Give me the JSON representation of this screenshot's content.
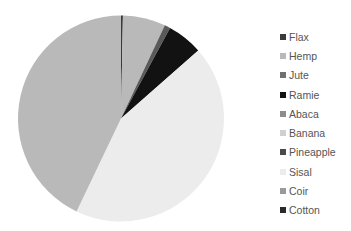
{
  "chart_data": {
    "type": "pie",
    "title": "",
    "categories": [
      "Flax",
      "Hemp",
      "Jute",
      "Ramie",
      "Abaca",
      "Banana",
      "Pineapple",
      "Sisal",
      "Coir",
      "Cotton"
    ],
    "values": [
      0.3,
      6.7,
      0.9,
      5.6,
      0.0,
      0.0,
      0.0,
      43.6,
      42.9,
      0.0
    ],
    "units": "percent (estimated from slice angles)",
    "start_angle_deg": 0,
    "direction": "clockwise",
    "legend_position": "right"
  },
  "legend": {
    "items": [
      {
        "label": "Flax",
        "color": "#3a3a3a"
      },
      {
        "label": "Hemp",
        "color": "#b9b9b9"
      },
      {
        "label": "Jute",
        "color": "#707070"
      },
      {
        "label": "Ramie",
        "color": "#121212"
      },
      {
        "label": "Abaca",
        "color": "#8c8c8c"
      },
      {
        "label": "Banana",
        "color": "#d0d0d0"
      },
      {
        "label": "Pineapple",
        "color": "#4a4a4a"
      },
      {
        "label": "Sisal",
        "color": "#ececec"
      },
      {
        "label": "Coir",
        "color": "#9a9a9a"
      },
      {
        "label": "Cotton",
        "color": "#2a2a2a"
      }
    ]
  },
  "slice_colors": [
    "#3a3a3a",
    "#b9b9b9",
    "#5a5a5a",
    "#121212",
    "#8c8c8c",
    "#d0d0d0",
    "#4a4a4a",
    "#ececec",
    "#b9b9b9",
    "#2a2a2a"
  ]
}
